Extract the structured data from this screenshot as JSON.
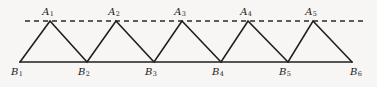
{
  "figure": {
    "caption": "",
    "background_color": "#f7f6f4",
    "stroke_color": "#1f1f1f",
    "dashed_line_color": "#2a2a2a"
  },
  "chart_data": {
    "type": "line",
    "title": "",
    "subtitle": "",
    "xlabel": "",
    "ylabel": "",
    "grid": false,
    "legend": null,
    "axis_ranges": {
      "x": [
        0,
        377
      ],
      "y": [
        0,
        87
      ]
    },
    "dashed_line": {
      "y": 21,
      "x_start": 25,
      "x_end": 366
    },
    "baseline": {
      "y": 62,
      "x_start": 20,
      "x_end": 352
    },
    "apex_points": [
      {
        "label": "A",
        "sub": "1",
        "x": 50,
        "y": 21
      },
      {
        "label": "A",
        "sub": "2",
        "x": 116,
        "y": 21
      },
      {
        "label": "A",
        "sub": "3",
        "x": 182,
        "y": 21
      },
      {
        "label": "A",
        "sub": "4",
        "x": 248,
        "y": 21
      },
      {
        "label": "A",
        "sub": "5",
        "x": 313,
        "y": 21
      }
    ],
    "base_points": [
      {
        "label": "B",
        "sub": "1",
        "x": 20,
        "y": 62
      },
      {
        "label": "B",
        "sub": "2",
        "x": 87,
        "y": 62
      },
      {
        "label": "B",
        "sub": "3",
        "x": 154,
        "y": 62
      },
      {
        "label": "B",
        "sub": "4",
        "x": 221,
        "y": 62
      },
      {
        "label": "B",
        "sub": "5",
        "x": 288,
        "y": 62
      },
      {
        "label": "B",
        "sub": "6",
        "x": 352,
        "y": 62
      }
    ],
    "zigzag_path": "M 20 62 L 50 21 L 87 62 L 116 21 L 154 62 L 182 21 L 221 62 L 248 21 L 288 62 L 313 21 L 352 62",
    "apex_label_offsets": {
      "dx": -2,
      "dy": -14
    },
    "base_label_offsets": {
      "dx": -3,
      "dy": 5
    }
  },
  "labels": {
    "apexes": [
      {
        "text": "A",
        "subscript": "1"
      },
      {
        "text": "A",
        "subscript": "2"
      },
      {
        "text": "A",
        "subscript": "3"
      },
      {
        "text": "A",
        "subscript": "4"
      },
      {
        "text": "A",
        "subscript": "5"
      }
    ],
    "bases": [
      {
        "text": "B",
        "subscript": "1"
      },
      {
        "text": "B",
        "subscript": "2"
      },
      {
        "text": "B",
        "subscript": "3"
      },
      {
        "text": "B",
        "subscript": "4"
      },
      {
        "text": "B",
        "subscript": "5"
      },
      {
        "text": "B",
        "subscript": "6"
      }
    ]
  }
}
